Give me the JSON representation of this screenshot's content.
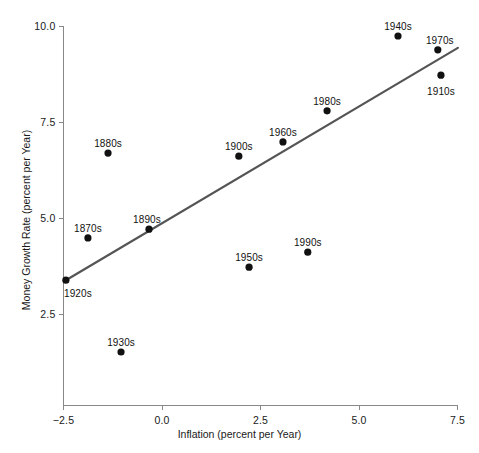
{
  "chart_data": {
    "type": "scatter",
    "title": "",
    "xlabel": "Inflation (percent per Year)",
    "ylabel": "Money Growth Rate (percent per Year)",
    "xlim": [
      -2.5,
      7.5
    ],
    "ylim": [
      2.5,
      10.0
    ],
    "xticks": [
      "-2.5",
      "0.0",
      "2.5",
      "5.0",
      "7.5"
    ],
    "xtick_values": [
      -2.5,
      0.0,
      2.5,
      5.0,
      7.5
    ],
    "yticks": [
      "2.5",
      "5.0",
      "7.5",
      "10.0"
    ],
    "ytick_values": [
      2.5,
      5.0,
      7.5,
      10.0
    ],
    "grid": false,
    "legend": "none",
    "marker_color": "#111111",
    "line_color": "#555555",
    "axis_color": "#888888",
    "points": [
      {
        "label": "1920s",
        "x": -2.44,
        "y": 3.38,
        "label_dx": 12,
        "label_dy": 14
      },
      {
        "label": "1870s",
        "x": -1.88,
        "y": 4.48,
        "label_dx": 0,
        "label_dy": -9
      },
      {
        "label": "1880s",
        "x": -1.37,
        "y": 6.69,
        "label_dx": 0,
        "label_dy": -9
      },
      {
        "label": "1890s",
        "x": -0.33,
        "y": 4.71,
        "label_dx": -2,
        "label_dy": -9
      },
      {
        "label": "1930s",
        "x": -1.04,
        "y": 1.51,
        "label_dx": 0,
        "label_dy": -9
      },
      {
        "label": "1900s",
        "x": 1.95,
        "y": 6.61,
        "label_dx": 0,
        "label_dy": -9
      },
      {
        "label": "1950s",
        "x": 2.21,
        "y": 3.72,
        "label_dx": 0,
        "label_dy": -9
      },
      {
        "label": "1960s",
        "x": 3.07,
        "y": 6.98,
        "label_dx": 0,
        "label_dy": -9
      },
      {
        "label": "1990s",
        "x": 3.7,
        "y": 4.11,
        "label_dx": 0,
        "label_dy": -9
      },
      {
        "label": "1980s",
        "x": 4.19,
        "y": 7.79,
        "label_dx": 0,
        "label_dy": -9
      },
      {
        "label": "1940s",
        "x": 5.99,
        "y": 9.74,
        "label_dx": 0,
        "label_dy": -9
      },
      {
        "label": "1970s",
        "x": 7.0,
        "y": 9.38,
        "label_dx": 2,
        "label_dy": -9
      },
      {
        "label": "1910s",
        "x": 7.08,
        "y": 8.72,
        "label_dx": 0,
        "label_dy": 17
      }
    ],
    "trendline": {
      "name": "fitted-regression-line",
      "x0": -2.44,
      "y0": 3.38,
      "x1": 7.51,
      "y1": 9.43
    }
  }
}
